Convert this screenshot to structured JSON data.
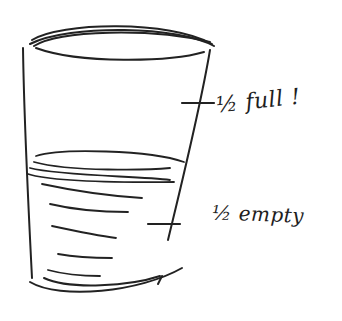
{
  "sketch": {
    "subject": "glass-half-full-half-empty",
    "stroke_color": "#222222",
    "background": "#ffffff"
  },
  "annotations": {
    "top_half": "½ full !",
    "bottom_half": "½ empty"
  }
}
